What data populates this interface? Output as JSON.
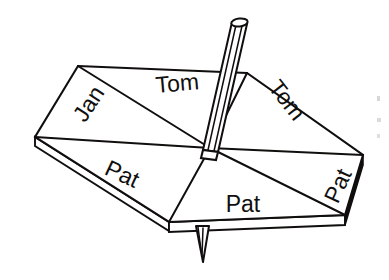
{
  "figure": {
    "background_color": "#ffffff",
    "ink_color": "#100f0d",
    "shading_color": "#100f0d"
  },
  "sectors": [
    {
      "id": "sector-top-left",
      "label": "Jan",
      "x": 95,
      "y": 108,
      "rotation": -57,
      "font_size": 23
    },
    {
      "id": "sector-top-center",
      "label": "Tom",
      "x": 178,
      "y": 91,
      "rotation": -5,
      "font_size": 25
    },
    {
      "id": "sector-top-right",
      "label": "Tom",
      "x": 281,
      "y": 105,
      "rotation": 52,
      "font_size": 24
    },
    {
      "id": "sector-bottom-left",
      "label": "Pat",
      "x": 119,
      "y": 181,
      "rotation": 25,
      "font_size": 24
    },
    {
      "id": "sector-bottom-center",
      "label": "Pat",
      "x": 243,
      "y": 212,
      "rotation": 0,
      "font_size": 25
    },
    {
      "id": "sector-bottom-right",
      "label": "Pat",
      "x": 345,
      "y": 189,
      "rotation": -65,
      "font_size": 24
    }
  ],
  "name_tally": {
    "Jan": 1,
    "Tom": 2,
    "Pat": 3,
    "total_sectors": 6
  },
  "parts": {
    "board": "spinner-board",
    "spindle": "spindle-shaft",
    "spindle_cap": "spindle-top-cap",
    "point": "spindle-point"
  },
  "geometry": {
    "center": {
      "x": 210,
      "y": 148
    },
    "board_vertices": [
      {
        "x": 78,
        "y": 66
      },
      {
        "x": 247,
        "y": 73
      },
      {
        "x": 363,
        "y": 155
      },
      {
        "x": 345,
        "y": 215
      },
      {
        "x": 169,
        "y": 222
      },
      {
        "x": 35,
        "y": 137
      }
    ],
    "board_thickness_px": 9
  }
}
